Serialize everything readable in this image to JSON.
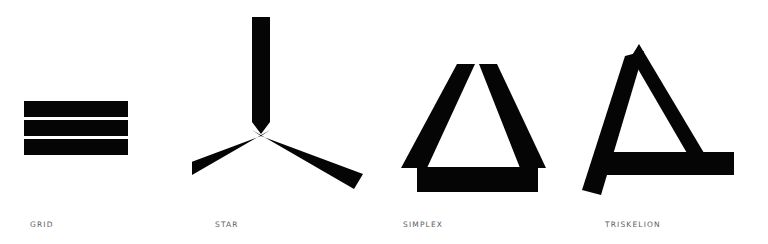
{
  "page": {
    "background_color": "#ffffff",
    "ink_color": "#050505",
    "caption_color": "#5d5d5d",
    "width": 768,
    "height": 244
  },
  "figures": [
    {
      "id": "grid",
      "caption": "GRID",
      "icon_name": "grid-glyph-icon",
      "description": "three stacked horizontal bars",
      "bar_count": 3
    },
    {
      "id": "star",
      "caption": "STAR",
      "icon_name": "star-glyph-icon",
      "description": "three radiating arms meeting at a center notch",
      "arm_count": 3
    },
    {
      "id": "simplex",
      "caption": "SIMPLEX",
      "icon_name": "simplex-glyph-icon",
      "description": "triangle formed of three detached thick bars",
      "bar_count": 3
    },
    {
      "id": "triskelion",
      "caption": "TRISKELION",
      "icon_name": "triskelion-glyph-icon",
      "description": "pinwheel triangle of three offset bars",
      "bar_count": 3
    }
  ]
}
